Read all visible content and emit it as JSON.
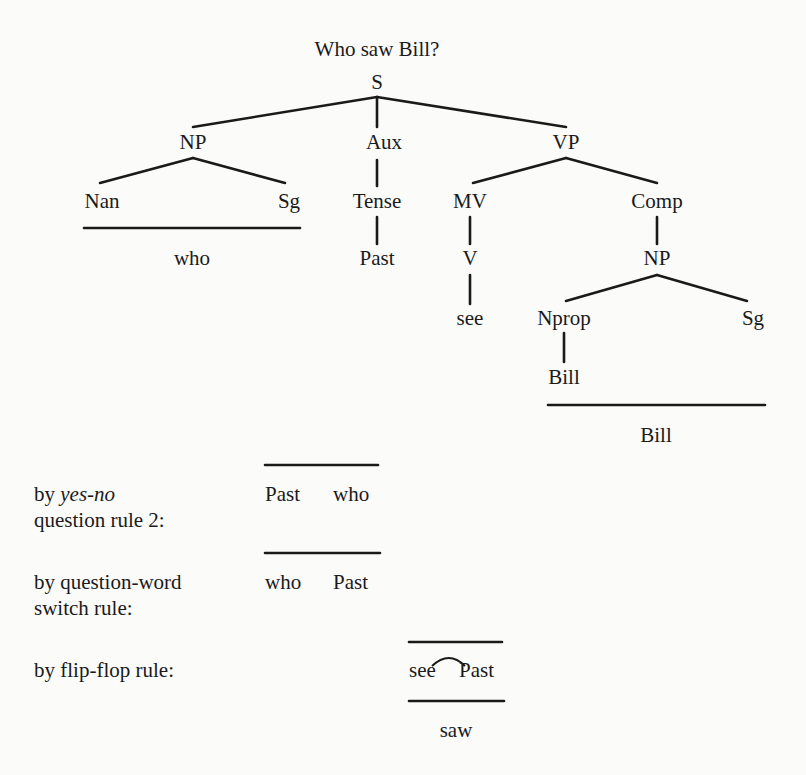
{
  "title": "Who saw Bill?",
  "tree": {
    "S": "S",
    "NP": "NP",
    "Aux": "Aux",
    "VP": "VP",
    "Nan": "Nan",
    "Sg1": "Sg",
    "who_underline": "who",
    "Tense": "Tense",
    "Past": "Past",
    "MV": "MV",
    "V": "V",
    "see": "see",
    "Comp": "Comp",
    "NP2": "NP",
    "Nprop": "Nprop",
    "Sg2": "Sg",
    "Bill_leaf": "Bill",
    "Bill_underline": "Bill"
  },
  "derivations": [
    {
      "rule_prefix": "by ",
      "rule_italic": "yes-no",
      "rule_line2": "question rule 2:",
      "result_a": "Past",
      "result_b": "who"
    },
    {
      "rule_line1": "by question-word",
      "rule_line2": "switch rule:",
      "result_a": "who",
      "result_b": "Past"
    },
    {
      "rule_line1": "by flip-flop rule:",
      "result_a": "see",
      "result_b": "Past",
      "output": "saw"
    }
  ]
}
